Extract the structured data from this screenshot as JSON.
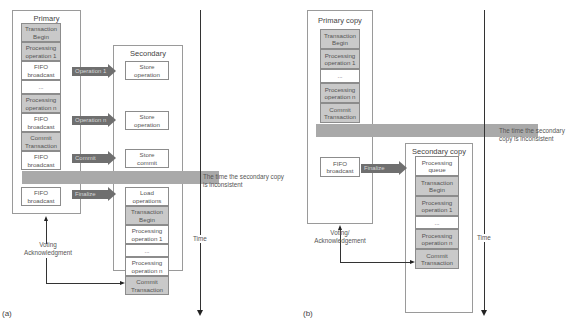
{
  "panel_a": {
    "label": "(a)",
    "primary": {
      "title": "Primary",
      "cells": [
        {
          "text": "Transaction\nBegin",
          "shaded": true
        },
        {
          "text": "Processing\noperation 1",
          "shaded": true
        },
        {
          "text": "FIFO\nbroadcast",
          "shaded": false
        },
        {
          "text": "...",
          "shaded": false
        },
        {
          "text": "Processing\noperation n",
          "shaded": true
        },
        {
          "text": "FIFO\nbroadcast",
          "shaded": false
        },
        {
          "text": "Commit\nTransaction",
          "shaded": true
        },
        {
          "text": "FIFO\nbroadcast",
          "shaded": false
        },
        {
          "text": "FIFO\nbroadcast",
          "shaded": false
        }
      ]
    },
    "secondary": {
      "title": "Secondary",
      "store_cells": [
        {
          "text": "Store\noperation"
        },
        {
          "text": "Store\noperation"
        },
        {
          "text": "Store\ncommit"
        }
      ],
      "cells": [
        {
          "text": "Load\noperations",
          "shaded": false
        },
        {
          "text": "Transaction\nBegin",
          "shaded": true
        },
        {
          "text": "Processing\noperation 1",
          "shaded": false
        },
        {
          "text": "...",
          "shaded": false
        },
        {
          "text": "Processing\noperation n",
          "shaded": false
        },
        {
          "text": "Commit\nTransaction",
          "shaded": true
        }
      ]
    },
    "arrows": [
      "Operation 1",
      "Operation n",
      "Commit",
      "Finalize"
    ],
    "inconsistent_label": "The time the secondary copy\nis inconsistent",
    "voting_label": "Voting\nAcknowledgment",
    "time_label": "Time"
  },
  "panel_b": {
    "label": "(b)",
    "primary": {
      "title": "Primary copy",
      "cells": [
        {
          "text": "Transaction\nBegin",
          "shaded": true
        },
        {
          "text": "Processing\noperation 1",
          "shaded": true
        },
        {
          "text": "...",
          "shaded": false
        },
        {
          "text": "Processing\noperation n",
          "shaded": true
        },
        {
          "text": "Commit\nTransaction",
          "shaded": true
        }
      ],
      "fifo": "FIFO\nbroadcast"
    },
    "secondary": {
      "title": "Secondary copy",
      "cells": [
        {
          "text": "Processing\nqueue",
          "shaded": false
        },
        {
          "text": "Transaction\nBegin",
          "shaded": true
        },
        {
          "text": "Processing\noperation 1",
          "shaded": true
        },
        {
          "text": "...",
          "shaded": false
        },
        {
          "text": "Processing\noperation n",
          "shaded": true
        },
        {
          "text": "Commit\nTransaction",
          "shaded": true
        }
      ]
    },
    "arrows": [
      "Finalize"
    ],
    "inconsistent_label": "The time the secondary\ncopy is inconsistent",
    "voting_label": "Voting/\nAcknowledgement",
    "time_label": "Time"
  }
}
